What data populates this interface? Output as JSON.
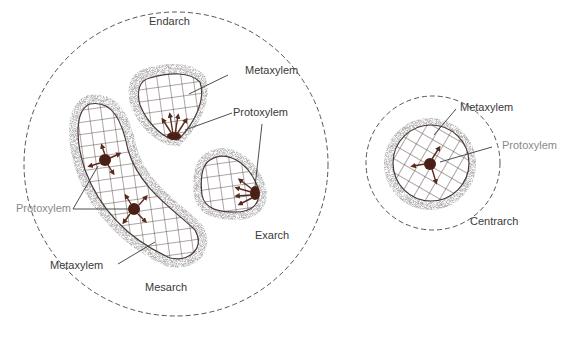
{
  "diagram": {
    "colors": {
      "outline": "#4a3a36",
      "protoxylem": "#4a1f16",
      "arrow": "#5a2a1e",
      "stipple": "#9a9a9a",
      "dashed_circle": "#555555",
      "text": "#3a3a3a",
      "text_gray": "#8a8a8a"
    },
    "left_group": {
      "labels": {
        "endarch": "Endarch",
        "metaxylem_top": "Metaxylem",
        "protoxylem_top": "Protoxylem",
        "protoxylem_left": "Protoxylem",
        "exarch": "Exarch",
        "metaxylem_bottom": "Metaxylem",
        "mesarch": "Mesarch"
      }
    },
    "right_group": {
      "labels": {
        "metaxylem": "Metaxylem",
        "protoxylem": "Protoxylem",
        "centrarch": "Centrarch"
      }
    }
  }
}
